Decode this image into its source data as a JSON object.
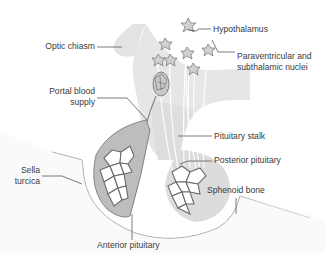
{
  "diagram": {
    "type": "anatomical-labeled-illustration",
    "colors": {
      "background": "#ffffff",
      "tissue_light": "#e6e6e6",
      "tissue_mid": "#d4d4d4",
      "anterior_fill": "#bdbdbd",
      "cell_fill": "#ffffff",
      "cell_outline": "#707070",
      "leader_line": "#5a5a5a",
      "bone_line": "#8a8a8a",
      "label_text": "#3a3a3a"
    },
    "labels": {
      "optic_chiasm": "Optic chiasm",
      "portal_blood_supply_1": "Portal blood",
      "portal_blood_supply_2": "supply",
      "hypothalamus": "Hypothalamus",
      "paraventricular_1": "Paraventricular and",
      "paraventricular_2": "subthalamic nuclei",
      "pituitary_stalk": "Pituitary stalk",
      "posterior_pituitary": "Posterior pituitary",
      "sphenoid_bone": "Sphenoid bone",
      "sella_turcica_1": "Sella",
      "sella_turcica_2": "turcica",
      "anterior_pituitary": "Anterior pituitary"
    }
  }
}
